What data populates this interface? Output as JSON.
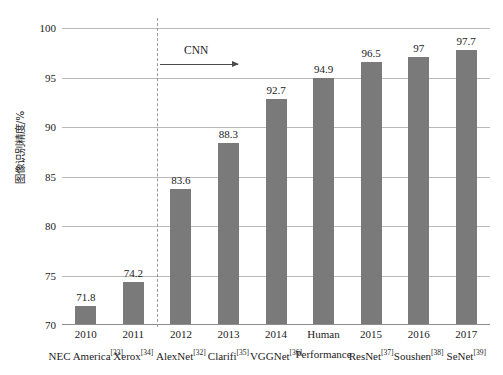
{
  "chart_data": {
    "type": "bar",
    "title": "",
    "xlabel": "",
    "ylabel": "图像识别精度/%",
    "ylim": [
      70,
      100
    ],
    "yticks": [
      70,
      75,
      80,
      85,
      90,
      95,
      100
    ],
    "grid": true,
    "legend": null,
    "bar_color": "#7a7a7a",
    "gridline_color": "#b9b9b9",
    "categories": [
      "2010",
      "2011",
      "2012",
      "2013",
      "2014",
      "Human",
      "2015",
      "2016",
      "2017"
    ],
    "sublabels": [
      "NEC America",
      "Xerox",
      "AlexNet",
      "Clarifi",
      "VGGNet",
      "Performance",
      "ResNet",
      "Soushen",
      "SeNet"
    ],
    "citations": [
      "33",
      "34",
      "32",
      "35",
      "36",
      "",
      "37",
      "38",
      "39"
    ],
    "values": [
      71.8,
      74.2,
      83.6,
      88.3,
      92.7,
      94.9,
      96.5,
      97,
      97.7
    ],
    "value_labels": [
      "71.8",
      "74.2",
      "83.6",
      "88.3",
      "92.7",
      "94.9",
      "96.5",
      "97",
      "97.7"
    ],
    "annotations": [
      {
        "text": "CNN",
        "kind": "arrow-annotation",
        "direction": "right",
        "after_category_index": 1
      }
    ],
    "divider": {
      "style": "dashed",
      "after_category_index": 1
    }
  }
}
